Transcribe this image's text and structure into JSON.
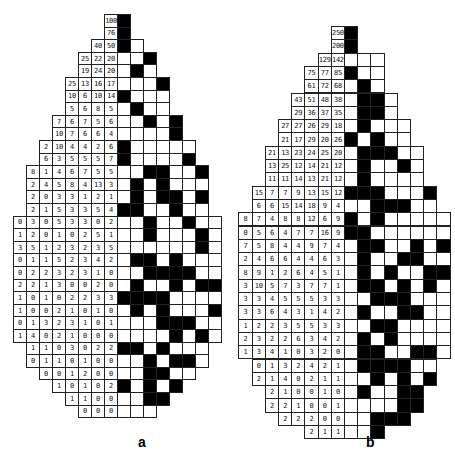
{
  "panels": [
    {
      "id": "a",
      "label": "a",
      "rows": [
        {
          "nums": [
            "100"
          ],
          "cells": "B"
        },
        {
          "nums": [
            "76"
          ],
          "cells": "B"
        },
        {
          "nums": [
            "40",
            "50"
          ],
          "cells": "BW"
        },
        {
          "nums": [
            "25",
            "22",
            "20"
          ],
          "cells": "WWB"
        },
        {
          "nums": [
            "19",
            "24",
            "20"
          ],
          "cells": "WBW"
        },
        {
          "nums": [
            "25",
            "13",
            "16",
            "17"
          ],
          "cells": "WWWB"
        },
        {
          "nums": [
            "10",
            "6",
            "10",
            "14"
          ],
          "cells": "BWWW"
        },
        {
          "nums": [
            "5",
            "6",
            "8",
            "5"
          ],
          "cells": "WBWW"
        },
        {
          "nums": [
            "7",
            "6",
            "7",
            "5",
            "6"
          ],
          "cells": "WWBWB"
        },
        {
          "nums": [
            "10",
            "7",
            "6",
            "6",
            "4"
          ],
          "cells": "WWWWB"
        },
        {
          "nums": [
            "2",
            "10",
            "4",
            "4",
            "2",
            "6"
          ],
          "cells": "BWWWWW"
        },
        {
          "nums": [
            "6",
            "3",
            "5",
            "5",
            "5",
            "7"
          ],
          "cells": "BWWWWB"
        },
        {
          "nums": [
            "8",
            "1",
            "4",
            "6",
            "7",
            "5",
            "5"
          ],
          "cells": "WWBBWWB"
        },
        {
          "nums": [
            "2",
            "4",
            "5",
            "8",
            "4",
            "13",
            "3"
          ],
          "cells": "WBWBWWW"
        },
        {
          "nums": [
            "2",
            "0",
            "3",
            "3",
            "1",
            "2",
            "1"
          ],
          "cells": "WBWBBWB"
        },
        {
          "nums": [
            "2",
            "1",
            "5",
            "3",
            "3",
            "5",
            "4"
          ],
          "cells": "BBWWBWW"
        },
        {
          "nums": [
            "0",
            "3",
            "0",
            "5",
            "3",
            "3",
            "0",
            "2"
          ],
          "cells": "WWBWWBWW"
        },
        {
          "nums": [
            "1",
            "2",
            "0",
            "1",
            "0",
            "2",
            "5",
            "1"
          ],
          "cells": "WWBWWWBW"
        },
        {
          "nums": [
            "3",
            "5",
            "1",
            "2",
            "3",
            "2",
            "3",
            "5"
          ],
          "cells": "WWWWWWBW"
        },
        {
          "nums": [
            "0",
            "1",
            "1",
            "5",
            "2",
            "3",
            "4",
            "2"
          ],
          "cells": "WBBWBWWW"
        },
        {
          "nums": [
            "0",
            "2",
            "2",
            "3",
            "2",
            "3",
            "1",
            "0"
          ],
          "cells": "WWBBBBWW"
        },
        {
          "nums": [
            "2",
            "2",
            "1",
            "3",
            "0",
            "0",
            "2",
            "0"
          ],
          "cells": "WBWWBWBB"
        },
        {
          "nums": [
            "1",
            "0",
            "1",
            "0",
            "2",
            "2",
            "3",
            "3"
          ],
          "cells": "BBBBWWWW"
        },
        {
          "nums": [
            "1",
            "0",
            "0",
            "2",
            "1",
            "0",
            "1",
            "0"
          ],
          "cells": "WBWBWWWB"
        },
        {
          "nums": [
            "0",
            "1",
            "3",
            "2",
            "3",
            "1",
            "0",
            "1"
          ],
          "cells": "WWWBBBWW"
        },
        {
          "nums": [
            "1",
            "4",
            "0",
            "2",
            "1",
            "0",
            "0",
            "0"
          ],
          "cells": "WWWWBWBW"
        },
        {
          "nums": [
            "1",
            "1",
            "0",
            "3",
            "0",
            "2",
            "2"
          ],
          "cells": "BBWBWWW"
        },
        {
          "nums": [
            "0",
            "1",
            "1",
            "0",
            "1",
            "0",
            "0"
          ],
          "cells": "WWBWBBW"
        },
        {
          "nums": [
            "0",
            "0",
            "1",
            "2",
            "0",
            "0"
          ],
          "cells": "WWBBWW"
        },
        {
          "nums": [
            "1",
            "0",
            "1",
            "0",
            "2"
          ],
          "cells": "BWBWB"
        },
        {
          "nums": [
            "1",
            "1",
            "0",
            "0"
          ],
          "cells": "WWBB"
        },
        {
          "nums": [
            "0",
            "0",
            "0"
          ],
          "cells": "WWW"
        }
      ]
    },
    {
      "id": "b",
      "label": "b",
      "rows": [
        {
          "nums": [
            "250"
          ],
          "cells": "B"
        },
        {
          "nums": [
            "200"
          ],
          "cells": "B"
        },
        {
          "nums": [
            "129",
            "142"
          ],
          "cells": "WWW"
        },
        {
          "nums": [
            "75",
            "77",
            "85"
          ],
          "cells": "BWW"
        },
        {
          "nums": [
            "61",
            "72",
            "68"
          ],
          "cells": "WBW"
        },
        {
          "nums": [
            "43",
            "51",
            "48",
            "38"
          ],
          "cells": "WBBW"
        },
        {
          "nums": [
            "29",
            "36",
            "37",
            "35"
          ],
          "cells": "WBBW"
        },
        {
          "nums": [
            "27",
            "27",
            "26",
            "29",
            "18"
          ],
          "cells": "WBWWW"
        },
        {
          "nums": [
            "21",
            "17",
            "29",
            "20",
            "26"
          ],
          "cells": "BWBWW"
        },
        {
          "nums": [
            "21",
            "13",
            "23",
            "24",
            "25",
            "20"
          ],
          "cells": "WBBBWW"
        },
        {
          "nums": [
            "13",
            "25",
            "12",
            "14",
            "21",
            "12"
          ],
          "cells": "WBWWBW"
        },
        {
          "nums": [
            "11",
            "11",
            "14",
            "13",
            "21",
            "12"
          ],
          "cells": "WBWWWW"
        },
        {
          "nums": [
            "15",
            "7",
            "7",
            "9",
            "13",
            "15",
            "12"
          ],
          "cells": "BBBWWWB"
        },
        {
          "nums": [
            "6",
            "6",
            "15",
            "14",
            "18",
            "9",
            "4"
          ],
          "cells": "WWBBBWW"
        },
        {
          "nums": [
            "8",
            "7",
            "4",
            "8",
            "8",
            "12",
            "6",
            "9"
          ],
          "cells": "BWBWWWWW"
        },
        {
          "nums": [
            "0",
            "5",
            "6",
            "4",
            "7",
            "7",
            "16",
            "9"
          ],
          "cells": "BBWWWWWW"
        },
        {
          "nums": [
            "7",
            "5",
            "8",
            "4",
            "4",
            "9",
            "7",
            "4"
          ],
          "cells": "WBBWWBWB"
        },
        {
          "nums": [
            "2",
            "4",
            "6",
            "6",
            "4",
            "4",
            "6",
            "3"
          ],
          "cells": "WBWWBBWW"
        },
        {
          "nums": [
            "8",
            "9",
            "1",
            "2",
            "6",
            "4",
            "5",
            "1"
          ],
          "cells": "WBWBWWBB"
        },
        {
          "nums": [
            "3",
            "10",
            "5",
            "7",
            "3",
            "7",
            "7",
            "1"
          ],
          "cells": "WBBWBWBW"
        },
        {
          "nums": [
            "3",
            "3",
            "4",
            "5",
            "5",
            "5",
            "3",
            "3"
          ],
          "cells": "WWBBBWWW"
        },
        {
          "nums": [
            "3",
            "3",
            "6",
            "4",
            "3",
            "1",
            "4",
            "2"
          ],
          "cells": "WBWWBBWW"
        },
        {
          "nums": [
            "1",
            "2",
            "2",
            "3",
            "5",
            "5",
            "3",
            "3"
          ],
          "cells": "WWBBWWWW"
        },
        {
          "nums": [
            "2",
            "3",
            "2",
            "2",
            "6",
            "3",
            "4",
            "2"
          ],
          "cells": "WBWBWWWW"
        },
        {
          "nums": [
            "1",
            "3",
            "4",
            "1",
            "0",
            "3",
            "2",
            "0"
          ],
          "cells": "WBBWWBBW"
        },
        {
          "nums": [
            "0",
            "1",
            "3",
            "2",
            "4",
            "2",
            "1"
          ],
          "cells": "WBBBBWW"
        },
        {
          "nums": [
            "2",
            "1",
            "4",
            "0",
            "2",
            "1",
            "1"
          ],
          "cells": "WWBWBWB"
        },
        {
          "nums": [
            "2",
            "1",
            "0",
            "0",
            "1",
            "0"
          ],
          "cells": "WBWWBB"
        },
        {
          "nums": [
            "2",
            "2",
            "1",
            "0",
            "0",
            "1"
          ],
          "cells": "WWWWBB"
        },
        {
          "nums": [
            "2",
            "2",
            "2",
            "0",
            "0"
          ],
          "cells": "WWBBB"
        },
        {
          "nums": [
            "2",
            "1",
            "1"
          ],
          "cells": "WWB"
        }
      ]
    }
  ]
}
